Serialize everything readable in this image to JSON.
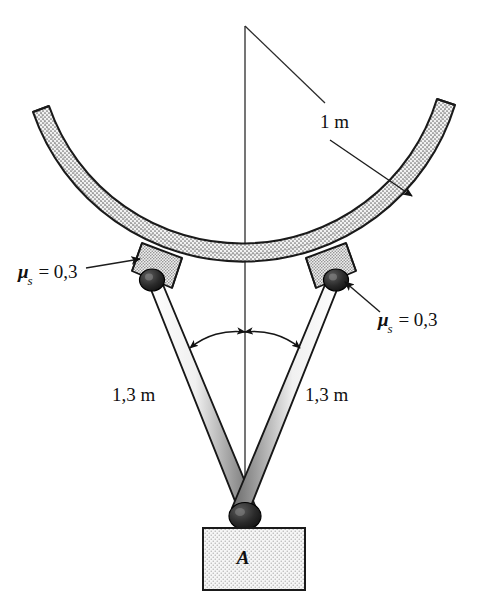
{
  "figure": {
    "background_color": "#ffffff",
    "line_color": "#1a1a1a",
    "shade_color": "#b9b9b9",
    "width": 487,
    "height": 604
  },
  "labels": {
    "friction_left": {
      "symbol": "μ",
      "subscript": "s",
      "relation": "=",
      "value": "0,3"
    },
    "friction_right": {
      "symbol": "μ",
      "subscript": "s",
      "relation": "=",
      "value": "0,3"
    },
    "radius": "1 m",
    "link_left_length": "1,3 m",
    "link_right_length": "1,3 m",
    "block_name": "A"
  },
  "annotations": {
    "radius_leader": "arrow from center apex to inner surface of curved rod",
    "friction_left_leader": "arrow pointing to left collar",
    "friction_right_leader": "arrow pointing to right collar",
    "angle_arc": "double-headed arc spanning both links about the vertical centerline"
  },
  "parts": {
    "curved_rod": "circular arc rod, stippled shading",
    "collar_left": "sliding collar clamped on rod, left",
    "collar_right": "sliding collar clamped on rod, right",
    "pin_left": "pin joint at left collar",
    "pin_right": "pin joint at right collar",
    "pin_bottom": "pin joint at block A",
    "link_left": "two-force link, left",
    "link_right": "two-force link, right",
    "block": "rectangular block labelled A",
    "centerline": "vertical construction line through center of curvature"
  }
}
